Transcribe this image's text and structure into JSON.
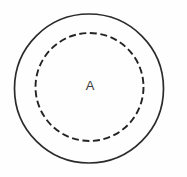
{
  "figure": {
    "type": "concentric-circles-diagram",
    "canvas": {
      "width": 187,
      "height": 177,
      "background": "#fefefe"
    },
    "outer_boundary": {
      "name": "outer-circle",
      "shape": "circle",
      "style": "solid",
      "center_x": 89,
      "center_y": 88.5,
      "radius": 74.5,
      "stroke_color": "#2b2b2b",
      "stroke_width": 1.7,
      "fill": "none"
    },
    "inner_boundary": {
      "name": "inner-circle",
      "shape": "circle",
      "style": "dashed",
      "center_x": 89.5,
      "center_y": 87,
      "radius": 54,
      "stroke_color": "#232323",
      "stroke_width": 1.9,
      "fill": "none",
      "dash_length": 7,
      "gap_length": 3.6
    },
    "labels": [
      {
        "name": "region-label-a",
        "text": "A",
        "x": 90,
        "y": 86.5,
        "font_size": 13,
        "color": "#3a3a3a"
      }
    ]
  }
}
